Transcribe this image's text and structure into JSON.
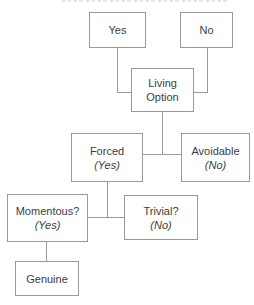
{
  "diagram": {
    "type": "flowchart",
    "nodes": {
      "yes": {
        "label": "Yes"
      },
      "no": {
        "label": "No"
      },
      "living_option": {
        "label": "Living Option"
      },
      "forced": {
        "label": "Forced",
        "qualifier": "(Yes)"
      },
      "avoidable": {
        "label": "Avoidable",
        "qualifier": "(No)"
      },
      "momentous": {
        "label": "Momentous?",
        "qualifier": "(Yes)"
      },
      "trivial": {
        "label": "Trivial?",
        "qualifier": "(No)"
      },
      "genuine": {
        "label": "Genuine"
      }
    },
    "edges": [
      {
        "from": "yes",
        "to": "living_option"
      },
      {
        "from": "no",
        "to": "living_option"
      },
      {
        "from": "living_option",
        "to": "forced"
      },
      {
        "from": "living_option",
        "to": "avoidable"
      },
      {
        "from": "forced",
        "to": "momentous"
      },
      {
        "from": "forced",
        "to": "trivial"
      },
      {
        "from": "momentous",
        "to": "genuine"
      }
    ],
    "colors": {
      "background": "#ffffff",
      "box_border": "#999999",
      "line": "#999999",
      "text": "#3d3d3d"
    }
  }
}
